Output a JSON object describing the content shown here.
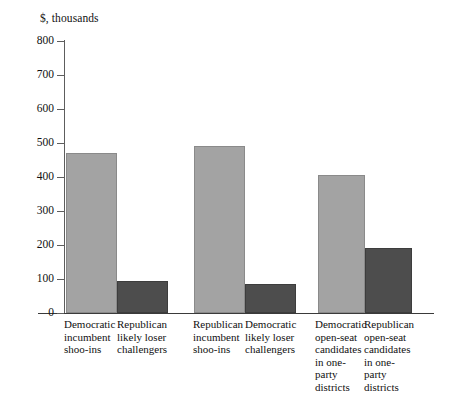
{
  "chart_data": {
    "type": "bar",
    "title": "",
    "subtitle": "",
    "ylabel": "$, thousands",
    "xlabel": "",
    "ylim": [
      0,
      800
    ],
    "yticks": [
      0,
      100,
      200,
      300,
      400,
      500,
      600,
      700,
      800
    ],
    "ytick_labels": [
      "0",
      "100",
      "200",
      "300",
      "400",
      "500",
      "600",
      "700",
      "800"
    ],
    "grid": false,
    "legend": "none",
    "categories": [
      "Democratic\nincumbent\nshoo-ins",
      "Republican\nlikely loser\nchallengers",
      "Republican\nincumbent\nshoo-ins",
      "Democratic\nlikely loser\nchallengers",
      "Democratic\nopen-seat\ncandidates\nin one-party\ndistricts",
      "Republican\nopen-seat\ncandidates\nin one-party\ndistricts"
    ],
    "values": [
      470,
      95,
      490,
      85,
      405,
      190
    ],
    "bar_colors": [
      "#a3a3a3",
      "#4d4d4d",
      "#a3a3a3",
      "#4d4d4d",
      "#a3a3a3",
      "#4d4d4d"
    ],
    "colors": {
      "light_bar": "#a3a3a3",
      "dark_bar": "#4d4d4d",
      "axis": "#5d5d5d",
      "text": "#111111",
      "background": "#ffffff"
    }
  }
}
